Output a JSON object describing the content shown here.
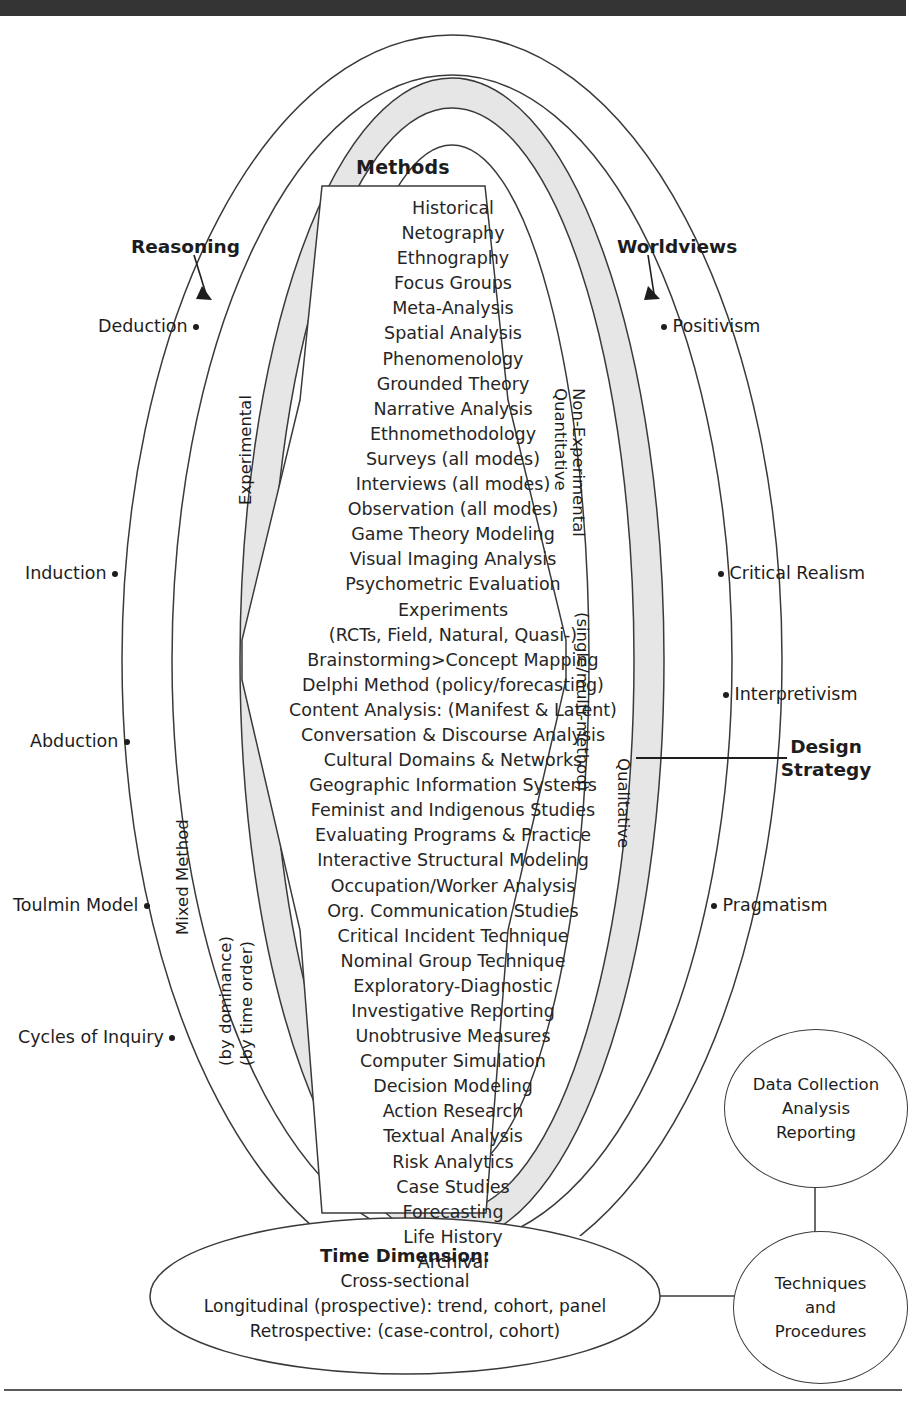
{
  "page": {
    "header_bar_color": "#333333",
    "band_fill": "#e6e6e6",
    "line_color": "#3a3a3a"
  },
  "methods": {
    "title": "Methods",
    "items": [
      "Historical",
      "Netography",
      "Ethnography",
      "Focus Groups",
      "Meta-Analysis",
      "Spatial Analysis",
      "Phenomenology",
      "Grounded Theory",
      "Narrative Analysis",
      "Ethnomethodology",
      "Surveys (all modes)",
      "Interviews (all modes)",
      "Observation (all modes)",
      "Game Theory Modeling",
      "Visual Imaging Analysis",
      "Psychometric Evaluation",
      "Experiments",
      "(RCTs, Field, Natural, Quasi-)",
      "Brainstorming>Concept Mapping",
      "Delphi Method (policy/forecasting)",
      "Content Analysis: (Manifest & Latent)",
      "Conversation & Discourse Analysis",
      "Cultural Domains & Networks",
      "Geographic Information Systems",
      "Feminist and Indigenous Studies",
      "Evaluating Programs & Practice",
      "Interactive Structural Modeling",
      "Occupation/Worker Analysis",
      "Org. Communication Studies",
      "Critical Incident Technique",
      "Nominal Group Technique",
      "Exploratory-Diagnostic",
      "Investigative Reporting",
      "Unobtrusive Measures",
      "Computer Simulation",
      "Decision Modeling",
      "Action Research",
      "Textual Analysis",
      "Risk Analytics",
      "Case Studies",
      "Forecasting",
      "Life History",
      "Archival"
    ]
  },
  "reasoning": {
    "heading": "Reasoning",
    "items": [
      {
        "label": "Deduction"
      },
      {
        "label": "Induction"
      },
      {
        "label": "Abduction"
      },
      {
        "label": "Toulmin Model"
      },
      {
        "label": "Cycles of Inquiry"
      }
    ]
  },
  "worldviews": {
    "heading": "Worldviews",
    "items": [
      {
        "label": "Positivism"
      },
      {
        "label": "Critical Realism"
      },
      {
        "label": "Interpretivism"
      },
      {
        "label": "Pragmatism"
      }
    ]
  },
  "band_labels": {
    "experimental": "Experimental",
    "mixed_method": "Mixed Method",
    "by_dominance": "(by dominance)",
    "by_time_order": "(by time order)",
    "non_experimental": "Non-Experimental",
    "quantitative": "Quantitative",
    "single_multi_method": "(single/multi-method)",
    "qualitative": "Qualitative"
  },
  "design_strategy": {
    "line1": "Design",
    "line2": "Strategy"
  },
  "time_dimension": {
    "title": "Time Dimension:",
    "lines": [
      "Cross-sectional",
      "Longitudinal (prospective): trend, cohort, panel",
      "Retrospective: (case-control, cohort)"
    ]
  },
  "circles": {
    "data_collection": {
      "line1": "Data Collection",
      "line2": "Analysis",
      "line3": "Reporting"
    },
    "techniques": {
      "line1": "Techniques",
      "line2": "and",
      "line3": "Procedures"
    }
  }
}
